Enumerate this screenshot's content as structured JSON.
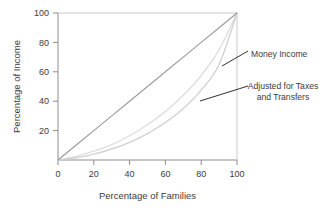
{
  "chart_data": {
    "type": "line",
    "title": "",
    "subtitle": "",
    "xlabel": "Percentage of Families",
    "ylabel": "Percentage of Income",
    "xlim": [
      0,
      100
    ],
    "ylim": [
      0,
      100
    ],
    "xticks": [
      0,
      20,
      40,
      60,
      80,
      100
    ],
    "yticks": [
      0,
      20,
      40,
      60,
      80,
      100
    ],
    "xtick_labels": [
      "0",
      "20",
      "40",
      "60",
      "80",
      "100"
    ],
    "ytick_labels": [
      "",
      "20",
      "40",
      "60",
      "80",
      "100"
    ],
    "grid": false,
    "legend_position": "annotations-right",
    "x": [
      0,
      10,
      20,
      30,
      40,
      50,
      60,
      70,
      80,
      90,
      100
    ],
    "series": [
      {
        "name": "Line of Equality",
        "color": "#9a9a9a",
        "labelled": false,
        "values": [
          0,
          10,
          20,
          30,
          40,
          50,
          60,
          70,
          80,
          90,
          100
        ]
      },
      {
        "name": "Money Income",
        "color": "#d2d2d2",
        "labelled": true,
        "values": [
          0,
          1.5,
          4.0,
          7.5,
          12.0,
          18.0,
          25.5,
          35.0,
          47.5,
          65.0,
          100
        ]
      },
      {
        "name": "Adjusted for Taxes and Transfers",
        "color": "#dedede",
        "labelled": true,
        "values": [
          0,
          2.5,
          6.0,
          10.5,
          16.5,
          24.0,
          33.0,
          44.0,
          57.5,
          75.0,
          100
        ]
      }
    ],
    "annotations": [
      {
        "id": "money-income",
        "text": "Money Income",
        "lines": [
          "Money Income"
        ],
        "align": "left",
        "label_x": 251,
        "label_y": 54,
        "leader_from_x": 248,
        "leader_from_y": 51,
        "leader_to_x": 222,
        "leader_to_y": 66
      },
      {
        "id": "adjusted-for-taxes-and-transfers",
        "text": "Adjusted for Taxes and Transfers",
        "lines": [
          "Adjusted for Taxes",
          "and Transfers"
        ],
        "align": "center",
        "label_x": 251,
        "label_y": 88,
        "leader_from_x": 248,
        "leader_from_y": 86,
        "leader_to_x": 200,
        "leader_to_y": 101
      }
    ],
    "colors": {
      "axis": "#8c8c8c",
      "text": "#3b3b3b",
      "leader": "#1a1a1a",
      "equality_line": "#9a9a9a",
      "money_income": "#d2d2d2",
      "adjusted": "#dedede",
      "background": "#ffffff"
    }
  }
}
